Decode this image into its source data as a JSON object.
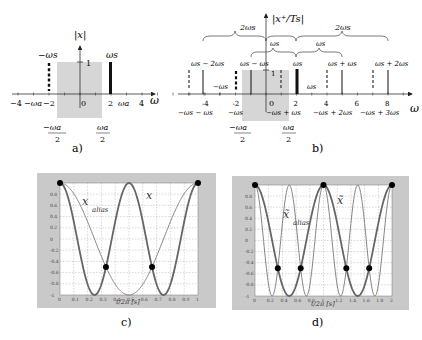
{
  "figure": {
    "panel_a": {
      "label": "a)",
      "y_axis_label": "|x|",
      "x_axis_label": "ω",
      "one_tick": "1",
      "ticks": [
        {
          "v": -4,
          "t": "−4"
        },
        {
          "v": -2,
          "t": "−2"
        },
        {
          "v": 0,
          "t": "0"
        },
        {
          "v": 2,
          "t": "2"
        },
        {
          "v": 4,
          "t": "4"
        }
      ],
      "omega_a_label": "ωa",
      "neg_omega_a_label": "−ωa",
      "neg_omega_s_label": "−ωs",
      "omega_s_label": "ωs",
      "band_left_num": "−ωa",
      "band_right_num": "ωa",
      "band_den": "2"
    },
    "panel_b": {
      "label": "b)",
      "y_axis_label": "|x⁺/Ts|",
      "x_axis_label": "ω",
      "one_tick": "1",
      "ticks": [
        {
          "v": -4,
          "t": "-4"
        },
        {
          "v": -2,
          "t": "-2"
        },
        {
          "v": 0,
          "t": "0"
        },
        {
          "v": 2,
          "t": "2"
        },
        {
          "v": 4,
          "t": "4"
        },
        {
          "v": 6,
          "t": "6"
        },
        {
          "v": 8,
          "t": "8"
        }
      ],
      "brace_top_left": "2ωs",
      "brace_top_right": "2ωs",
      "brace_mid_left": "ωs",
      "brace_mid_right": "ωs",
      "top_labels": [
        "ωs − 2ωs",
        "ωs − ωs",
        "ωs",
        "ωs + ωs",
        "ωs + 2ωs"
      ],
      "inner_labels": [
        "−ωs",
        "ωs"
      ],
      "bottom_labels": [
        "−ωs − ωs",
        "−ωs",
        "−ωs + ωs",
        "−ωs + 2ωs",
        "−ωs + 3ωs"
      ],
      "band_left_num": "−ωa",
      "band_right_num": "ωa",
      "band_den": "2"
    },
    "panel_c": {
      "label": "c)",
      "xlabel": "t/2π [s]",
      "curve_main": "x",
      "curve_alias": "x",
      "alias_sub": "alias"
    },
    "panel_d": {
      "label": "d)",
      "xlabel": "t/2π [s]",
      "curve_main": "x̃",
      "curve_alias": "x̃",
      "alias_sub": "alias"
    }
  },
  "chart_data": [
    {
      "type": "line",
      "title": "c)",
      "xlabel": "t/2π [s]",
      "ylabel": "",
      "xlim": [
        0,
        1
      ],
      "ylim": [
        -1,
        1
      ],
      "grid": true,
      "x_ticks": [
        "0",
        "0.1",
        "0.2",
        "0.3",
        "0.4",
        "0.5",
        "0.6",
        "0.7",
        "0.8",
        "0.9",
        "1"
      ],
      "y_ticks": [
        "-1",
        "-0.8",
        "-0.6",
        "-0.4",
        "-0.2",
        "0",
        "0.2",
        "0.4",
        "0.6",
        "0.8"
      ],
      "series": [
        {
          "name": "x",
          "function": "cos(4πt)",
          "style": "thick"
        },
        {
          "name": "x_alias",
          "function": "cos(2πt)",
          "style": "thin"
        }
      ],
      "sample_points": [
        {
          "x": 0,
          "y": 1
        },
        {
          "x": 0.333,
          "y": -0.5
        },
        {
          "x": 0.667,
          "y": -0.5
        },
        {
          "x": 1,
          "y": 1
        }
      ]
    },
    {
      "type": "line",
      "title": "d)",
      "xlabel": "t/2π [s]",
      "ylabel": "",
      "xlim": [
        0,
        2
      ],
      "ylim": [
        -1,
        1
      ],
      "grid": true,
      "x_ticks": [
        "0",
        "0.2",
        "0.4",
        "0.6",
        "0.8",
        "1",
        "1.2",
        "1.4",
        "1.6",
        "1.8",
        "2"
      ],
      "y_ticks": [
        "-1",
        "-0.8",
        "-0.6",
        "-0.4",
        "-0.2",
        "0",
        "0.2",
        "0.4",
        "0.6",
        "0.8"
      ],
      "series": [
        {
          "name": "x̃",
          "function": "cos(2πt)",
          "style": "thick"
        },
        {
          "name": "x̃_alias",
          "function": "cos(4πt)",
          "style": "thin"
        }
      ],
      "sample_points": [
        {
          "x": 0,
          "y": 1
        },
        {
          "x": 0.333,
          "y": -0.5
        },
        {
          "x": 0.667,
          "y": -0.5
        },
        {
          "x": 1,
          "y": 1
        },
        {
          "x": 1.333,
          "y": -0.5
        },
        {
          "x": 1.667,
          "y": -0.5
        },
        {
          "x": 2,
          "y": 1
        }
      ]
    }
  ]
}
